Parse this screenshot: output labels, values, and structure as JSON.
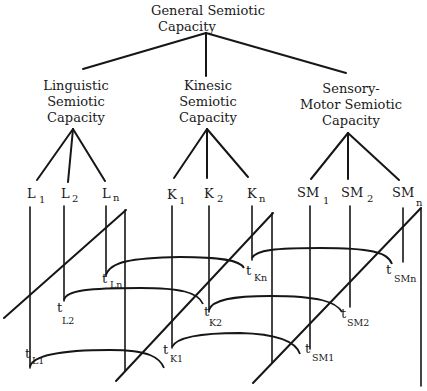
{
  "root": {
    "label_line1": "General Semiotic",
    "label_line2": "Capacity"
  },
  "branches": [
    {
      "id": "linguistic",
      "lines": [
        "Linguistic",
        "Semiotic",
        "Capacity"
      ]
    },
    {
      "id": "kinesic",
      "lines": [
        "Kinesic",
        "Semiotic",
        "Capacity"
      ]
    },
    {
      "id": "sensory-motor",
      "lines": [
        "Sensory-",
        "Motor Semiotic",
        "Capacity"
      ]
    }
  ],
  "nodes": [
    {
      "base": "L",
      "sub": "1"
    },
    {
      "base": "L",
      "sub": "2"
    },
    {
      "base": "L",
      "sub": "n"
    },
    {
      "base": "K",
      "sub": "1"
    },
    {
      "base": "K",
      "sub": "2"
    },
    {
      "base": "K",
      "sub": "n"
    },
    {
      "base": "SM",
      "sub": "1"
    },
    {
      "base": "SM",
      "sub": "2"
    },
    {
      "base": "SM",
      "sub": "n"
    }
  ],
  "time_points": [
    {
      "base": "t",
      "sub": "Ln"
    },
    {
      "base": "t",
      "sub": "L2"
    },
    {
      "base": "t",
      "sub": "L1"
    },
    {
      "base": "t",
      "sub": "Kn"
    },
    {
      "base": "t",
      "sub": "K2"
    },
    {
      "base": "t",
      "sub": "K1"
    },
    {
      "base": "t",
      "sub": "SMn"
    },
    {
      "base": "t",
      "sub": "SM2"
    },
    {
      "base": "t",
      "sub": "SM1"
    }
  ],
  "colors": {
    "ink": "#161616",
    "background": "#ffffff"
  }
}
